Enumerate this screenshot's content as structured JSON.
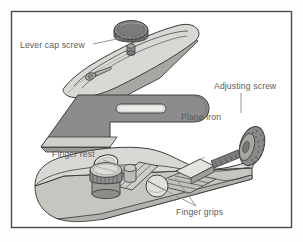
{
  "figure": {
    "background_color": "#fdfdfc",
    "frame": {
      "name": "illustration-frame",
      "border_color": "#4a4a4a",
      "inner_fill": "#ffffff"
    }
  },
  "palette": {
    "outline": "#3d3d3d",
    "body_light": "#d9d8d4",
    "body_mid": "#bdbcb7",
    "body_shadow": "#a8a7a2",
    "blade_gray": "#8c8c8c",
    "blade_light": "#cfcfcb",
    "knob_dark": "#6f6f6f",
    "knob_mid": "#8e8e8e",
    "label_text": "#5a5a5a",
    "leader_line": "#8a8a8a"
  },
  "labels": [
    {
      "id": "lever-cap-screw",
      "text": "Lever cap screw",
      "x": 20,
      "y": 48,
      "anchor": "start",
      "leader": "M 93 44 L 131 36"
    },
    {
      "id": "adjusting-screw",
      "text": "Adjusting screw",
      "x": 214,
      "y": 89,
      "anchor": "start",
      "leader": "M 241 93 L 241 113"
    },
    {
      "id": "plane-iron",
      "text": "Plane iron",
      "x": 181,
      "y": 120,
      "anchor": "start",
      "leader": "M 178 117 L 162 117"
    },
    {
      "id": "finger-rest",
      "text": "Finger rest",
      "x": 52,
      "y": 157,
      "anchor": "start",
      "leader": "M 103 160 L 124 167"
    },
    {
      "id": "finger-grips",
      "text": "Finger grips",
      "x": 176,
      "y": 215,
      "anchor": "start",
      "leader": "M 196 206 L 165 190 M 196 206 L 175 178"
    }
  ],
  "parts": [
    {
      "id": "lever-cap",
      "name": "Lever cap"
    },
    {
      "id": "lever-cap-screw-knob",
      "name": "Lever cap screw"
    },
    {
      "id": "plane-iron-blade",
      "name": "Plane iron"
    },
    {
      "id": "plane-body",
      "name": "Plane body"
    },
    {
      "id": "adjusting-screw-wheel",
      "name": "Adjusting screw"
    },
    {
      "id": "finger-rest-knob",
      "name": "Finger rest"
    },
    {
      "id": "finger-grip-recesses",
      "name": "Finger grips"
    }
  ]
}
